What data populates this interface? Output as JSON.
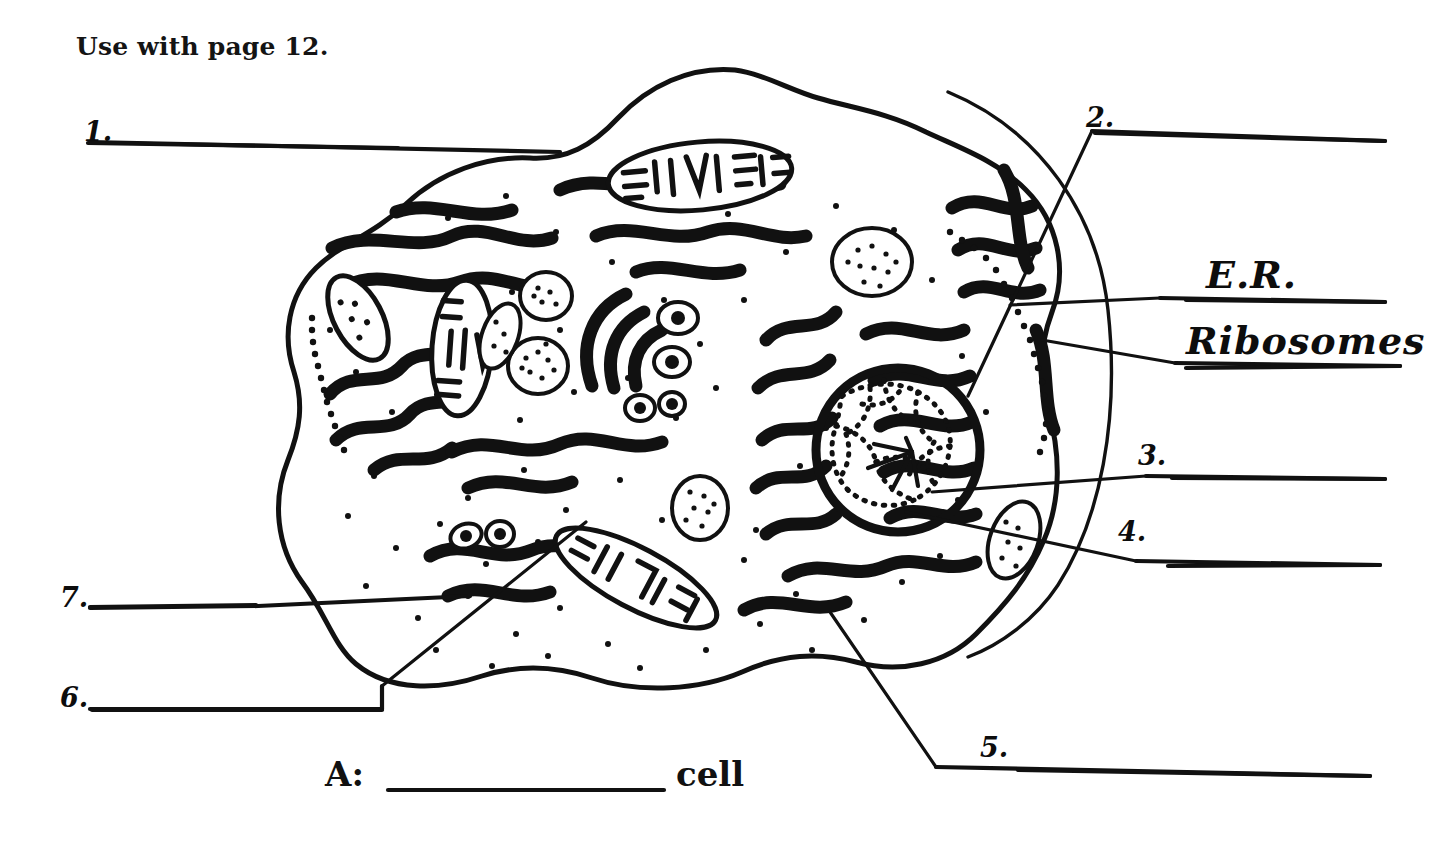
{
  "page": {
    "header_note": "Use with page 12.",
    "worksheet_type": "cell-diagram-labeling",
    "ink_color": "#111111",
    "paper_color": "#ffffff"
  },
  "caption": {
    "prefix": "A:",
    "blank": "_____________",
    "suffix": "cell"
  },
  "labels": [
    {
      "id": "1",
      "number": "1.",
      "kind": "blank-line",
      "x": 84,
      "y": 122
    },
    {
      "id": "2",
      "number": "2.",
      "kind": "blank-line",
      "x": 1086,
      "y": 104
    },
    {
      "id": "er",
      "number": "E.R.",
      "kind": "answer-filled",
      "x": 1206,
      "y": 258
    },
    {
      "id": "rb",
      "number": "Ribosomes",
      "kind": "answer-filled",
      "x": 1186,
      "y": 324
    },
    {
      "id": "3",
      "number": "3.",
      "kind": "blank-line",
      "x": 1138,
      "y": 443
    },
    {
      "id": "4",
      "number": "4.",
      "kind": "blank-line",
      "x": 1118,
      "y": 518
    },
    {
      "id": "5",
      "number": "5.",
      "kind": "blank-line",
      "x": 980,
      "y": 735
    },
    {
      "id": "6",
      "number": "6.",
      "kind": "blank-line",
      "x": 60,
      "y": 685
    },
    {
      "id": "7",
      "number": "7.",
      "kind": "blank-line",
      "x": 60,
      "y": 585
    }
  ],
  "diagram": {
    "name": "animal-cell-cross-section",
    "organelles": [
      "cell-membrane",
      "cytoplasm",
      "nucleus",
      "nucleolus",
      "chromatin",
      "endoplasmic-reticulum",
      "ribosomes",
      "mitochondria",
      "golgi-apparatus",
      "lysosomes",
      "vacuoles",
      "vesicles"
    ],
    "mitochondria_count": 4,
    "stippled_vesicle_count": 6
  }
}
